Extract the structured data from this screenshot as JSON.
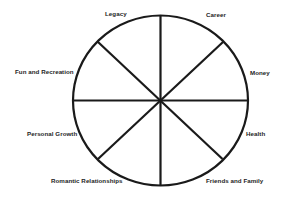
{
  "diagram": {
    "type": "wheel-of-life",
    "center": {
      "x": 160.5,
      "y": 100.5
    },
    "radius": {
      "rx": 87.5,
      "ry": 85
    },
    "stroke_color": "#1a1a1a",
    "segments": 8
  },
  "labels": {
    "legacy": "Legacy",
    "career": "Career",
    "fun_and_recreation": "Fun and Recreation",
    "money": "Money",
    "personal_growth": "Personal Growth",
    "health": "Health",
    "romantic_relationships": "Romantic Relationships",
    "friends_and_family": "Friends and Family"
  }
}
